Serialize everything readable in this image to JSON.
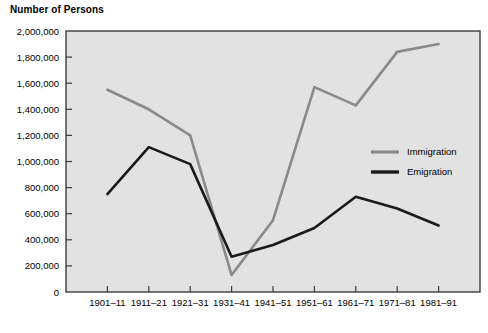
{
  "chart_data": {
    "type": "line",
    "title": "Number of Persons",
    "xlabel": "",
    "ylabel": "",
    "ylim": [
      0,
      2000000
    ],
    "grid": false,
    "legend_position": "right-middle",
    "categories": [
      "1901–11",
      "1911–21",
      "1921–31",
      "1931–41",
      "1941–51",
      "1951–61",
      "1961–71",
      "1971–81",
      "1981–91"
    ],
    "ytick_labels": [
      "0",
      "200,000",
      "400,000",
      "600,000",
      "800,000",
      "1,000,000",
      "1,200,000",
      "1,400,000",
      "1,600,000",
      "1,800,000",
      "2,000,000"
    ],
    "ytick_values": [
      0,
      200000,
      400000,
      600000,
      800000,
      1000000,
      1200000,
      1400000,
      1600000,
      1800000,
      2000000
    ],
    "series": [
      {
        "name": "Immigration",
        "color": "#8a8a8a",
        "values": [
          1550000,
          1400000,
          1200000,
          130000,
          550000,
          1570000,
          1430000,
          1840000,
          1900000
        ]
      },
      {
        "name": "Emigration",
        "color": "#1a1a1a",
        "values": [
          750000,
          1110000,
          980000,
          270000,
          360000,
          490000,
          730000,
          640000,
          510000
        ]
      }
    ]
  },
  "colors": {
    "plot_background": "#e2e2e2",
    "plot_border": "#3c3c3c",
    "page_background": "#ffffff",
    "text": "#000000"
  }
}
